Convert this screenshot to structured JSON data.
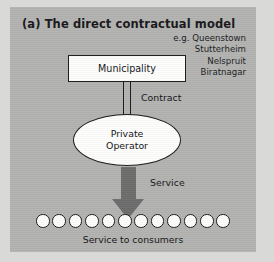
{
  "figure": {
    "title": "(a) The direct contractual model",
    "examples_list": [
      "e.g. Queenstown",
      "Stutterheim",
      "Nelspruit",
      "Biratnagar"
    ],
    "nodes": {
      "authority": "Municipality",
      "operator_line1": "Private",
      "operator_line2": "Operator"
    },
    "edges": {
      "contract": "Contract",
      "service": "Service"
    },
    "consumers": {
      "count": 12,
      "caption": "Service to consumers"
    },
    "colors": {
      "panel_background": "#b2b2b0",
      "page_background": "#d9d9d7",
      "node_fill": "#fdfdfc",
      "stroke": "#18181a",
      "arrow": "#6c6c6c"
    }
  }
}
